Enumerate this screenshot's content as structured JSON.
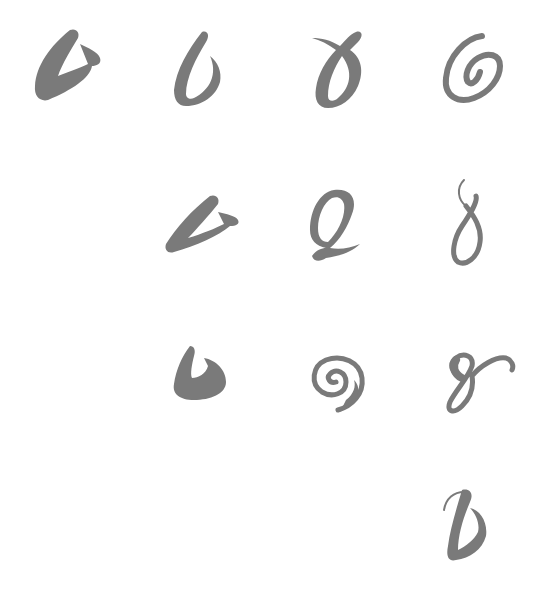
{
  "sheet": {
    "background": "#ffffff",
    "ink_color": "#7a7a7a",
    "rows": [
      {
        "row": 1,
        "glyphs": [
          "wedge-stroke",
          "open-loop-stroke",
          "crossed-loop-stroke",
          "spiral-stroke"
        ]
      },
      {
        "row": 2,
        "glyphs": [
          "slanted-wedge-stroke",
          "q-loop-stroke",
          "figure-eight-stroke"
        ]
      },
      {
        "row": 3,
        "glyphs": [
          "hook-stroke",
          "snail-spiral-stroke",
          "flourish-loop-stroke"
        ]
      },
      {
        "row": 4,
        "glyphs": [
          "swash-stroke"
        ]
      }
    ]
  }
}
